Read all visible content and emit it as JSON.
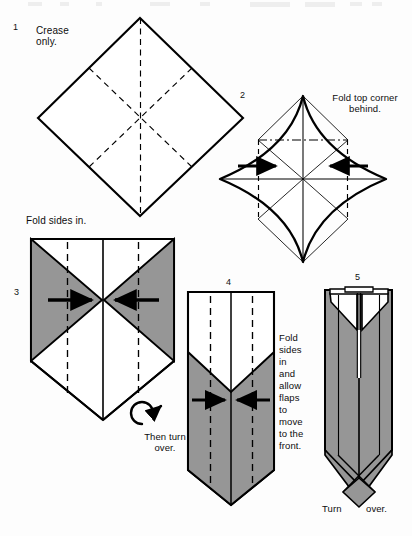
{
  "document": {
    "kind": "origami-folding-instructions",
    "page_background": "#fdfdfd",
    "ink_color": "#000000",
    "shading_color": "#969696",
    "paper_color": "#ffffff"
  },
  "steps": [
    {
      "number": "1",
      "caption": "Crease\nonly.",
      "shape": "square-diamond",
      "notes": "Square rotated 45 degrees, dashed vertical, horizontal-diagonal crease lines"
    },
    {
      "number": "2",
      "caption": "Fold top corner\nbehind.",
      "shape": "concave-star-diamond",
      "notes": "Four-point star with concave sides, dash-dot fold line near top, two solid arrows pointing inward"
    },
    {
      "number": "3",
      "caption": "Fold sides in.",
      "secondary_caption": "Then turn\nover.",
      "shape": "shield-with-side-triangles",
      "notes": "Gray triangular flaps on left and right, dashed vertical fold lines, inward arrows, turn-over loop arrow"
    },
    {
      "number": "4",
      "caption": "Fold\nsides\nin\nand\nallow\nflaps\nto\nmove\nto the\nfront.",
      "shape": "tall-vee-column",
      "notes": "Tall gray column with white V-notch top and pointed bottom, dashed vertical fold lines, inward arrows"
    },
    {
      "number": "5",
      "caption_left": "Turn",
      "caption_right": "over.",
      "shape": "collar-column",
      "notes": "Narrow gray column with white collar/lapel triangles at top and crossed point at bottom"
    }
  ],
  "icons": {
    "arrow_right": "arrow-right-icon",
    "arrow_left": "arrow-left-icon",
    "turn_over_loop": "turn-over-loop-arrow-icon",
    "turn_over_point": "turn-over-pointer-icon"
  },
  "line_styles": {
    "solid_edge": "solid",
    "valley_fold": "dashed",
    "mountain_fold": "dash-dot"
  }
}
